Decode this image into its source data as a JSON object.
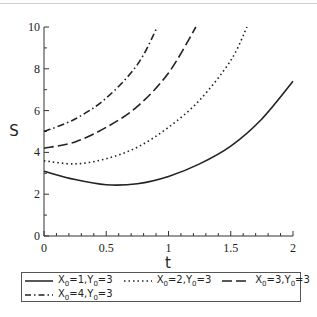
{
  "chart_data": {
    "type": "line",
    "title": "",
    "xlabel": "t",
    "ylabel": "S",
    "xlim": [
      0,
      2
    ],
    "ylim": [
      0,
      10
    ],
    "grid": false,
    "legend_position": "bottom",
    "x_ticks": [
      "0",
      "0.5",
      "1",
      "1.5",
      "2"
    ],
    "y_ticks": [
      "0",
      "2",
      "4",
      "6",
      "8",
      "10"
    ],
    "series": [
      {
        "name": "X0=1,Y0=3",
        "style": "solid",
        "x": [
          0,
          0.25,
          0.5,
          0.75,
          1.0,
          1.25,
          1.5,
          1.75,
          2.0
        ],
        "values": [
          3.1,
          2.7,
          2.45,
          2.5,
          2.85,
          3.45,
          4.3,
          5.6,
          7.4
        ]
      },
      {
        "name": "X0=2,Y0=3",
        "style": "dotted",
        "x": [
          0,
          0.25,
          0.5,
          0.75,
          1.0,
          1.25,
          1.5,
          1.63
        ],
        "values": [
          3.6,
          3.45,
          3.7,
          4.25,
          5.2,
          6.5,
          8.4,
          10.0
        ]
      },
      {
        "name": "X0=3,Y0=3",
        "style": "dashed",
        "x": [
          0,
          0.25,
          0.5,
          0.75,
          1.0,
          1.22
        ],
        "values": [
          4.2,
          4.5,
          5.2,
          6.2,
          7.8,
          10.0
        ]
      },
      {
        "name": "X0=4,Y0=3",
        "style": "dashdot",
        "x": [
          0,
          0.25,
          0.5,
          0.75,
          0.91
        ],
        "values": [
          5.0,
          5.6,
          6.6,
          8.2,
          10.0
        ]
      }
    ]
  },
  "legend": {
    "items": [
      {
        "x_sub": "0",
        "x_val": "1",
        "y_sub": "0",
        "y_val": "3",
        "style": "solid"
      },
      {
        "x_sub": "0",
        "x_val": "2",
        "y_sub": "0",
        "y_val": "3",
        "style": "dotted"
      },
      {
        "x_sub": "0",
        "x_val": "3",
        "y_sub": "0",
        "y_val": "3",
        "style": "dashed"
      },
      {
        "x_sub": "0",
        "x_val": "4",
        "y_sub": "0",
        "y_val": "3",
        "style": "dashdot"
      }
    ]
  },
  "colors": {
    "line": "#222222",
    "axis": "#333333",
    "legend_border": "#555555"
  }
}
